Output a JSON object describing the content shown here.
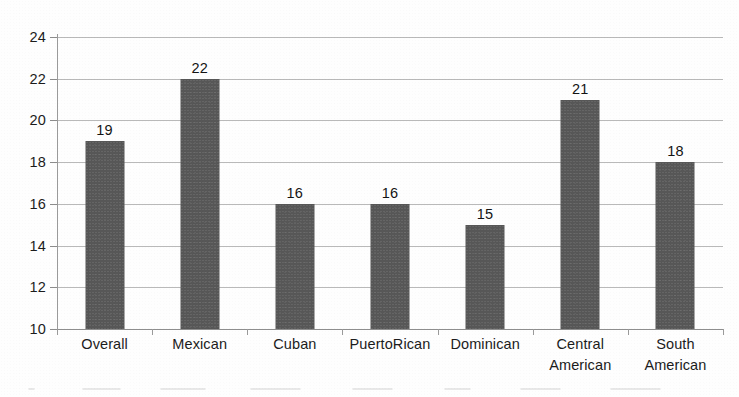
{
  "chart_data": {
    "type": "bar",
    "title": "",
    "xlabel": "",
    "ylabel": "",
    "categories": [
      "Overall",
      "Mexican",
      "Cuban",
      "PuertoRican",
      "Dominican",
      "Central American",
      "South American"
    ],
    "values": [
      19,
      22,
      16,
      16,
      15,
      21,
      18
    ],
    "data_labels": [
      "19",
      "22",
      "16",
      "16",
      "15",
      "21",
      "18"
    ],
    "ylim": [
      10,
      24
    ],
    "yticks": [
      10,
      12,
      14,
      16,
      18,
      20,
      22,
      24
    ],
    "ytick_labels": [
      "10",
      "12",
      "14",
      "16",
      "18",
      "20",
      "22",
      "24"
    ],
    "grid": "horizontal",
    "legend": "none",
    "bar_color": "#575757",
    "gridline_color": "#b9b9b9",
    "axis_color": "#8e8e8e",
    "background_color": "#fefefe",
    "text_color": "#1c1c1c"
  }
}
